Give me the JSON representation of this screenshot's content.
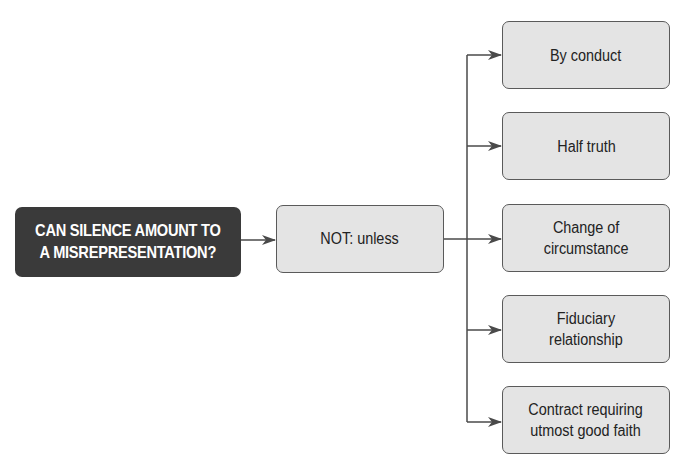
{
  "diagram": {
    "type": "flowchart",
    "root": {
      "label": "CAN SILENCE AMOUNT TO A MISREPRESENTATION?",
      "line1": "CAN SILENCE AMOUNT TO",
      "line2": "A MISREPRESENTATION?"
    },
    "middle": {
      "label": "NOT: unless"
    },
    "branches": [
      {
        "line1": "By conduct",
        "line2": ""
      },
      {
        "line1": "Half truth",
        "line2": ""
      },
      {
        "line1": "Change of",
        "line2": "circumstance"
      },
      {
        "line1": "Fiduciary",
        "line2": "relationship"
      },
      {
        "line1": "Contract requiring",
        "line2": "utmost good faith"
      }
    ],
    "colors": {
      "root_fill": "#3a3a3a",
      "box_fill": "#e4e4e4",
      "border": "#5a5a5a",
      "line": "#4a4a4a"
    }
  }
}
